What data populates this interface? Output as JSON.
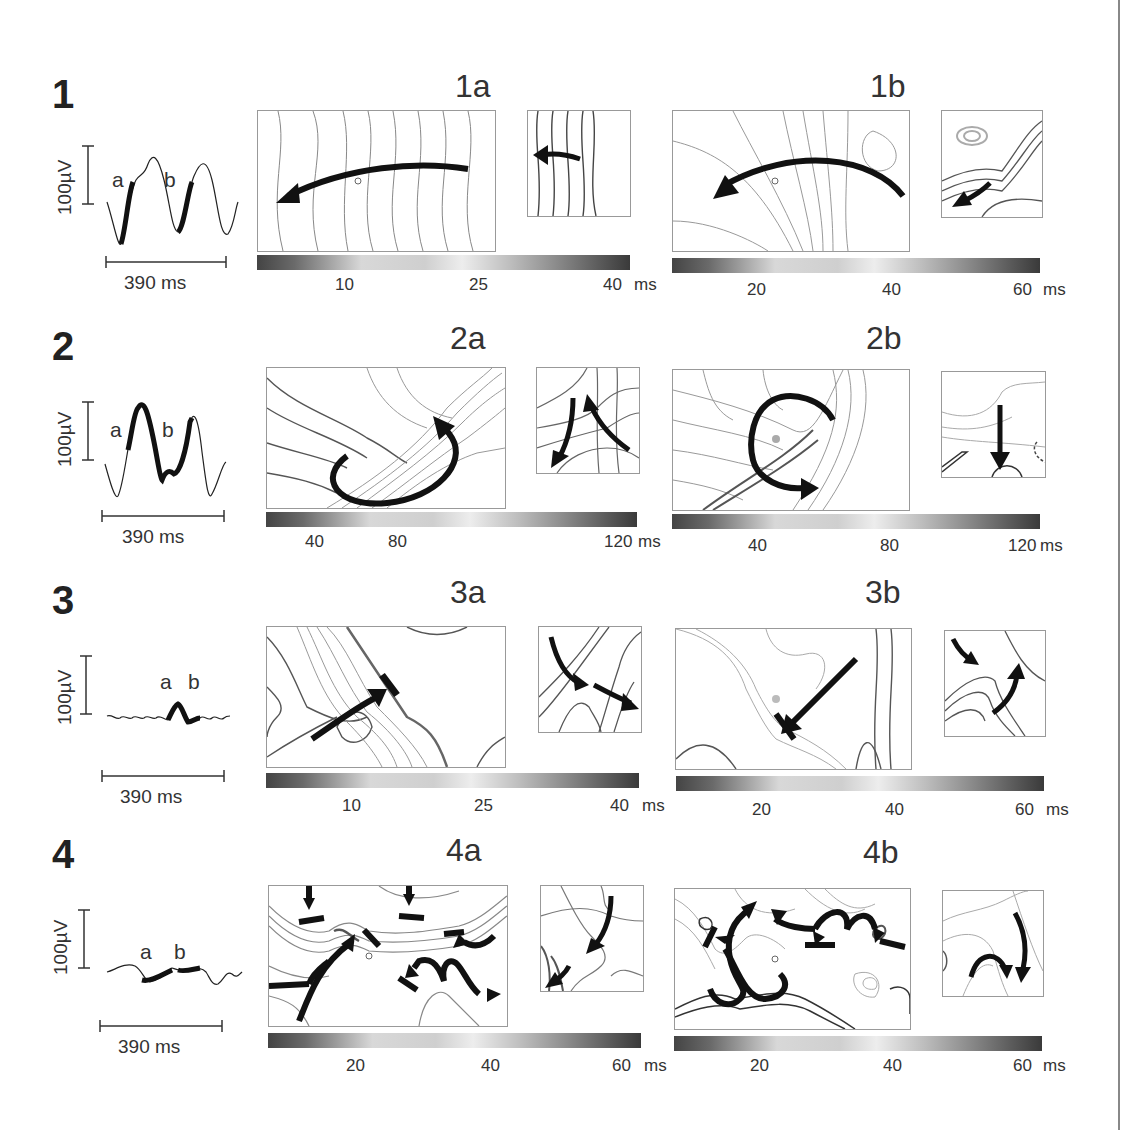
{
  "figure": {
    "rows": [
      {
        "number": "1",
        "waveform": {
          "scale": "100µV",
          "duration": "390 ms",
          "label_a": "a",
          "label_b": "b"
        },
        "panels": [
          {
            "title": "1a",
            "colorbar_ticks": [
              "10",
              "25",
              "40"
            ],
            "colorbar_unit": "ms"
          },
          {
            "title": "1b",
            "colorbar_ticks": [
              "20",
              "40",
              "60"
            ],
            "colorbar_unit": "ms"
          }
        ]
      },
      {
        "number": "2",
        "waveform": {
          "scale": "100µV",
          "duration": "390 ms",
          "label_a": "a",
          "label_b": "b"
        },
        "panels": [
          {
            "title": "2a",
            "colorbar_ticks": [
              "40",
              "80",
              "120"
            ],
            "colorbar_unit": "ms"
          },
          {
            "title": "2b",
            "colorbar_ticks": [
              "40",
              "80",
              "120"
            ],
            "colorbar_unit": "ms"
          }
        ]
      },
      {
        "number": "3",
        "waveform": {
          "scale": "100µV",
          "duration": "390 ms",
          "label_a": "a",
          "label_b": "b"
        },
        "panels": [
          {
            "title": "3a",
            "colorbar_ticks": [
              "10",
              "25",
              "40"
            ],
            "colorbar_unit": "ms"
          },
          {
            "title": "3b",
            "colorbar_ticks": [
              "20",
              "40",
              "60"
            ],
            "colorbar_unit": "ms"
          }
        ]
      },
      {
        "number": "4",
        "waveform": {
          "scale": "100µV",
          "duration": "390 ms",
          "label_a": "a",
          "label_b": "b"
        },
        "panels": [
          {
            "title": "4a",
            "colorbar_ticks": [
              "20",
              "40",
              "60"
            ],
            "colorbar_unit": "ms"
          },
          {
            "title": "4b",
            "colorbar_ticks": [
              "20",
              "40",
              "60"
            ],
            "colorbar_unit": "ms"
          }
        ]
      }
    ]
  }
}
